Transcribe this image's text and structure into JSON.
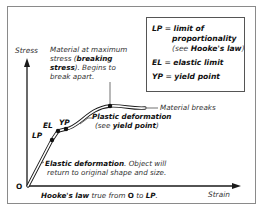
{
  "diagram": {
    "type": "stress-strain curve",
    "axes": {
      "y_label": "Stress",
      "x_label": "Strain",
      "origin_label": "O"
    },
    "points": [
      {
        "id": "LP",
        "label": "LP"
      },
      {
        "id": "EL",
        "label": "EL"
      },
      {
        "id": "YP",
        "label": "YP"
      }
    ],
    "annotations": {
      "breaking": {
        "line1": "Material at maximum",
        "line2_pre": "stress (",
        "line2_bold": "breaking",
        "line3_bold": "stress",
        "line3_post": "). Begins to",
        "line4": "break apart."
      },
      "material_breaks": "Material breaks",
      "plastic": {
        "bold": "Plastic deformation",
        "pre": "(see ",
        "link_bold": "yield point",
        "post": ")"
      },
      "elastic": {
        "bold": "Elastic deformation",
        "post": ". Object will",
        "line2": "return to original shape and size."
      },
      "hookes": {
        "bold": "Hooke's law",
        "mid": " true from ",
        "from_bold": "O",
        "to_text": " to ",
        "to_bold": "LP",
        "end": "."
      }
    },
    "legend": {
      "rows": [
        {
          "key": "LP",
          "eq": " = ",
          "value": "limit of"
        },
        {
          "value2": "proportionality"
        },
        {
          "pre": "(see ",
          "bold": "Hooke's law",
          "post": ")"
        },
        {
          "key": "EL",
          "eq": " = ",
          "value": "elastic limit"
        },
        {
          "key": "YP",
          "eq": " = ",
          "value": "yield point"
        }
      ]
    },
    "colors": {
      "line": "#1a1a1a",
      "frame": "#8a8a8a",
      "text": "#333333"
    }
  }
}
